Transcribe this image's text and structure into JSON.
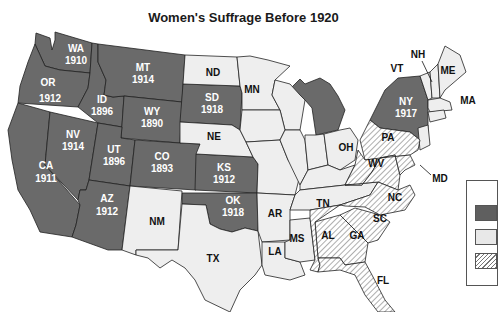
{
  "title": "Women's Suffrage Before 1920",
  "colors": {
    "full_suffrage": "#6a6a6a",
    "no_suffrage": "#eeeeee",
    "partial_suffrage_hatch": "#777777",
    "border": "#222222"
  },
  "legend": {
    "items": [
      {
        "key": "full",
        "swatch": "dark-gray"
      },
      {
        "key": "none",
        "swatch": "light-gray"
      },
      {
        "key": "partial",
        "swatch": "hatched"
      }
    ]
  },
  "states": {
    "WA": {
      "abbr": "WA",
      "year": "1910",
      "status": "full"
    },
    "OR": {
      "abbr": "OR",
      "year": "1912",
      "status": "full"
    },
    "CA": {
      "abbr": "CA",
      "year": "1911",
      "status": "full"
    },
    "ID": {
      "abbr": "ID",
      "year": "1896",
      "status": "full"
    },
    "NV": {
      "abbr": "NV",
      "year": "1914",
      "status": "full"
    },
    "MT": {
      "abbr": "MT",
      "year": "1914",
      "status": "full"
    },
    "WY": {
      "abbr": "WY",
      "year": "1890",
      "status": "full"
    },
    "UT": {
      "abbr": "UT",
      "year": "1896",
      "status": "full"
    },
    "CO": {
      "abbr": "CO",
      "year": "1893",
      "status": "full"
    },
    "AZ": {
      "abbr": "AZ",
      "year": "1912",
      "status": "full"
    },
    "SD": {
      "abbr": "SD",
      "year": "1918",
      "status": "full"
    },
    "KS": {
      "abbr": "KS",
      "year": "1912",
      "status": "full"
    },
    "OK": {
      "abbr": "OK",
      "year": "1918",
      "status": "full"
    },
    "NY": {
      "abbr": "NY",
      "year": "1917",
      "status": "full"
    },
    "MI": {
      "abbr": "",
      "year": "",
      "status": "full"
    },
    "ND": {
      "abbr": "ND",
      "status": "none"
    },
    "NE": {
      "abbr": "NE",
      "status": "none"
    },
    "MN": {
      "abbr": "MN",
      "status": "none"
    },
    "NM": {
      "abbr": "NM",
      "status": "none"
    },
    "TX": {
      "abbr": "TX",
      "status": "none"
    },
    "AR": {
      "abbr": "AR",
      "status": "none"
    },
    "LA": {
      "abbr": "LA",
      "status": "none"
    },
    "MS": {
      "abbr": "MS",
      "status": "none"
    },
    "TN": {
      "abbr": "TN",
      "status": "none"
    },
    "OH": {
      "abbr": "OH",
      "status": "none"
    },
    "VT": {
      "abbr": "VT",
      "status": "none"
    },
    "NH": {
      "abbr": "NH",
      "status": "none"
    },
    "ME": {
      "abbr": "ME",
      "status": "none"
    },
    "MA": {
      "abbr": "MA",
      "status": "none"
    },
    "PA": {
      "abbr": "PA",
      "status": "partial"
    },
    "WV": {
      "abbr": "WV",
      "status": "partial"
    },
    "MD": {
      "abbr": "MD",
      "status": "partial"
    },
    "NC": {
      "abbr": "NC",
      "status": "partial"
    },
    "SC": {
      "abbr": "SC",
      "status": "partial"
    },
    "AL": {
      "abbr": "AL",
      "status": "partial"
    },
    "GA": {
      "abbr": "GA",
      "status": "partial"
    },
    "FL": {
      "abbr": "FL",
      "status": "partial"
    }
  }
}
